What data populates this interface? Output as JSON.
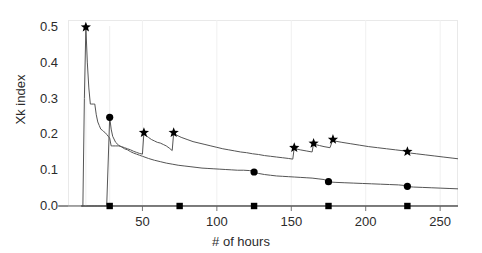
{
  "chart_data": {
    "type": "line",
    "title": "",
    "xlabel": "# of hours",
    "ylabel": "Xk index",
    "xlim": [
      0,
      262
    ],
    "ylim": [
      0.0,
      0.52
    ],
    "xticks": [
      50,
      100,
      150,
      200,
      250
    ],
    "xtick_labels": [
      "50",
      "100",
      "150",
      "200",
      "250"
    ],
    "yticks": [
      0.0,
      0.1,
      0.2,
      0.3,
      0.4,
      0.5
    ],
    "ytick_labels": [
      "0.0",
      "0.1",
      "0.2",
      "0.3",
      "0.4",
      "0.5"
    ],
    "grid": false,
    "legend": "none",
    "line_color": "#555555",
    "marker_color": "#000000",
    "series": [
      {
        "name": "upper-curve",
        "marker": "star",
        "marker_points": [
          {
            "x": 12,
            "y": 0.5
          },
          {
            "x": 51,
            "y": 0.205
          },
          {
            "x": 71,
            "y": 0.205
          },
          {
            "x": 152,
            "y": 0.163
          },
          {
            "x": 165,
            "y": 0.175
          },
          {
            "x": 178,
            "y": 0.186
          },
          {
            "x": 228,
            "y": 0.152
          }
        ],
        "x": [
          9,
          10,
          11,
          12,
          13,
          14,
          15,
          16,
          17,
          18,
          19,
          20,
          21,
          22,
          23,
          24,
          25,
          26,
          27,
          28,
          29,
          30,
          32,
          34,
          36,
          38,
          40,
          42,
          44,
          46,
          48,
          50,
          51,
          52,
          54,
          56,
          58,
          60,
          62,
          64,
          66,
          68,
          70,
          71,
          72,
          74,
          76,
          80,
          84,
          88,
          92,
          96,
          100,
          104,
          108,
          112,
          116,
          120,
          124,
          128,
          132,
          136,
          140,
          144,
          148,
          151,
          152,
          153,
          156,
          160,
          164,
          165,
          166,
          169,
          172,
          176,
          178,
          179,
          180,
          184,
          190,
          196,
          202,
          208,
          214,
          220,
          226,
          228,
          229,
          230,
          234,
          240,
          246,
          252,
          258,
          262
        ],
        "y": [
          0.0,
          0.0,
          0.3,
          0.5,
          0.4,
          0.33,
          0.285,
          0.285,
          0.285,
          0.285,
          0.255,
          0.235,
          0.225,
          0.215,
          0.212,
          0.208,
          0.205,
          0.2,
          0.195,
          0.19,
          0.168,
          0.168,
          0.168,
          0.168,
          0.166,
          0.163,
          0.16,
          0.157,
          0.153,
          0.15,
          0.147,
          0.145,
          0.205,
          0.198,
          0.192,
          0.186,
          0.182,
          0.178,
          0.176,
          0.172,
          0.168,
          0.162,
          0.155,
          0.205,
          0.2,
          0.196,
          0.192,
          0.186,
          0.18,
          0.176,
          0.172,
          0.168,
          0.164,
          0.16,
          0.157,
          0.154,
          0.151,
          0.149,
          0.146,
          0.144,
          0.141,
          0.139,
          0.137,
          0.135,
          0.133,
          0.131,
          0.163,
          0.16,
          0.157,
          0.154,
          0.151,
          0.175,
          0.172,
          0.169,
          0.166,
          0.163,
          0.186,
          0.183,
          0.181,
          0.178,
          0.174,
          0.17,
          0.166,
          0.163,
          0.16,
          0.157,
          0.154,
          0.152,
          0.15,
          0.148,
          0.146,
          0.143,
          0.14,
          0.137,
          0.134,
          0.132
        ]
      },
      {
        "name": "lower-curve",
        "marker": "circle",
        "marker_points": [
          {
            "x": 28,
            "y": 0.248
          },
          {
            "x": 125,
            "y": 0.095
          },
          {
            "x": 175,
            "y": 0.068
          },
          {
            "x": 228,
            "y": 0.055
          }
        ],
        "x": [
          9,
          10,
          11,
          12,
          14,
          16,
          18,
          20,
          22,
          24,
          26,
          28,
          29,
          30,
          32,
          34,
          36,
          38,
          40,
          42,
          44,
          46,
          48,
          50,
          54,
          58,
          62,
          66,
          70,
          74,
          78,
          82,
          86,
          90,
          94,
          98,
          102,
          106,
          110,
          114,
          118,
          122,
          124,
          125,
          126,
          128,
          132,
          136,
          140,
          144,
          148,
          152,
          156,
          160,
          164,
          168,
          172,
          175,
          176,
          180,
          186,
          192,
          198,
          204,
          210,
          216,
          222,
          227,
          228,
          229,
          232,
          238,
          244,
          250,
          256,
          262
        ],
        "y": [
          0.0,
          0.0,
          0.0,
          0.0,
          0.0,
          0.0,
          0.0,
          0.0,
          0.0,
          0.0,
          0.0,
          0.248,
          0.215,
          0.195,
          0.178,
          0.17,
          0.165,
          0.16,
          0.157,
          0.152,
          0.148,
          0.145,
          0.142,
          0.139,
          0.133,
          0.128,
          0.124,
          0.12,
          0.117,
          0.114,
          0.112,
          0.11,
          0.108,
          0.106,
          0.105,
          0.104,
          0.103,
          0.102,
          0.101,
          0.1,
          0.1,
          0.099,
          0.098,
          0.095,
          0.093,
          0.091,
          0.088,
          0.086,
          0.084,
          0.083,
          0.082,
          0.081,
          0.08,
          0.079,
          0.078,
          0.076,
          0.074,
          0.068,
          0.067,
          0.066,
          0.065,
          0.064,
          0.063,
          0.062,
          0.061,
          0.06,
          0.059,
          0.057,
          0.055,
          0.054,
          0.053,
          0.052,
          0.051,
          0.05,
          0.049,
          0.048
        ]
      },
      {
        "name": "zero-line",
        "marker": "square",
        "marker_points": [
          {
            "x": 28,
            "y": 0.0
          },
          {
            "x": 75,
            "y": 0.0
          },
          {
            "x": 125,
            "y": 0.0
          },
          {
            "x": 175,
            "y": 0.0
          },
          {
            "x": 228,
            "y": 0.0
          }
        ],
        "x": [
          9,
          262
        ],
        "y": [
          0.0,
          0.0
        ]
      }
    ]
  }
}
